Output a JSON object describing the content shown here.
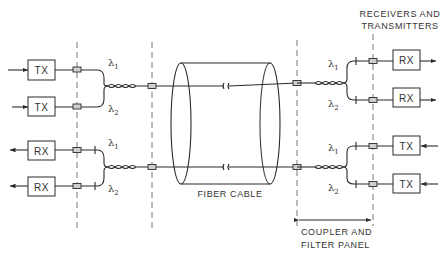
{
  "diagram": {
    "type": "wavelength-division-multiplexing fiber link",
    "left_terminal": {
      "upper_group": [
        {
          "label": "TX",
          "wavelength": "λ1",
          "sub": "1"
        },
        {
          "label": "TX",
          "wavelength": "λ2",
          "sub": "2"
        }
      ],
      "lower_group": [
        {
          "label": "RX",
          "wavelength": "λ1",
          "sub": "1"
        },
        {
          "label": "RX",
          "wavelength": "λ2",
          "sub": "2"
        }
      ]
    },
    "right_terminal": {
      "upper_group": [
        {
          "label": "RX",
          "wavelength": "λ1",
          "sub": "1"
        },
        {
          "label": "RX",
          "wavelength": "λ2",
          "sub": "2"
        }
      ],
      "lower_group": [
        {
          "label": "TX",
          "wavelength": "λ1",
          "sub": "1"
        },
        {
          "label": "TX",
          "wavelength": "λ2",
          "sub": "2"
        }
      ]
    },
    "lambda_symbol": "λ",
    "labels": {
      "cable": "FIBER CABLE",
      "receivers_line1": "RECEIVERS AND",
      "receivers_line2": "TRANSMITTERS",
      "panel_line1": "COUPLER AND",
      "panel_line2": "FILTER PANEL"
    },
    "colors": {
      "line": "#2a2a2a",
      "dashed": "#666666",
      "connector_fill": "#cfcfcf",
      "text": "#333333"
    }
  }
}
